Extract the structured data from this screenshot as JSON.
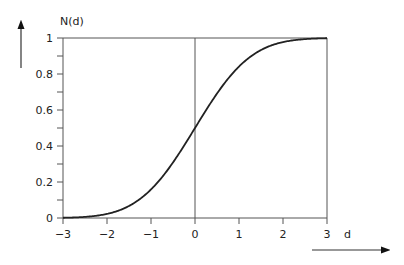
{
  "chart_data": {
    "type": "line",
    "title": "",
    "xlabel": "d",
    "ylabel": "N(d)",
    "xlim": [
      -3,
      3
    ],
    "ylim": [
      0,
      1
    ],
    "x_ticks": [
      "-3",
      "-2",
      "-1",
      "0",
      "1",
      "2",
      "3"
    ],
    "y_ticks": [
      "0",
      "0.2",
      "0.4",
      "0.6",
      "0.8",
      "1"
    ],
    "y_minor_step": 0.1,
    "grid": false,
    "legend": null,
    "series": [
      {
        "name": "N(d) standard normal CDF",
        "x": [
          -3,
          -2.5,
          -2,
          -1.5,
          -1,
          -0.5,
          0,
          0.5,
          1,
          1.5,
          2,
          2.5,
          3
        ],
        "y": [
          0.001,
          0.006,
          0.023,
          0.067,
          0.159,
          0.309,
          0.5,
          0.691,
          0.841,
          0.933,
          0.977,
          0.994,
          0.999
        ]
      }
    ],
    "annotations": [
      "vertical line at d = 0",
      "frame line at N(d) = 1",
      "arrow up beside y-axis",
      "arrow right below x-axis"
    ]
  },
  "labels": {
    "ylabel": "N(d)",
    "xlabel": "d",
    "x_ticks": [
      "−3",
      "−2",
      "−1",
      "0",
      "1",
      "2",
      "3"
    ],
    "y_ticks": [
      "0",
      "0.2",
      "0.4",
      "0.6",
      "0.8",
      "1"
    ]
  },
  "colors": {
    "curve": "#222222",
    "axis": "#555555"
  }
}
